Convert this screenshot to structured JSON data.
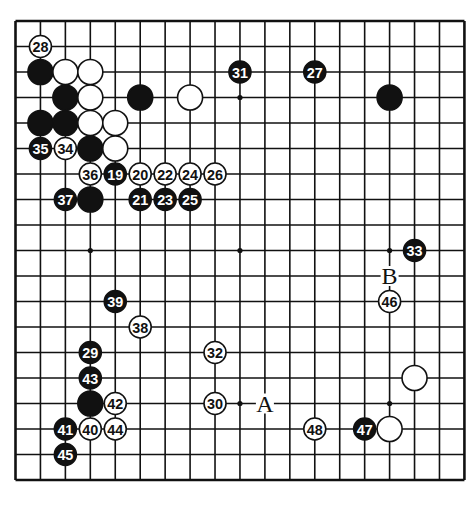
{
  "diagram": {
    "type": "go-board",
    "size": 19,
    "colors": {
      "background": "#ffffff",
      "line": "#111111",
      "black_stone": "#111111",
      "white_stone": "#ffffff",
      "black_text": "#ffffff",
      "white_text": "#111111"
    },
    "geometry": {
      "left": 15.5,
      "top": 21,
      "step_x": 24.94,
      "step_y": 25.5
    },
    "star_points": [
      [
        3,
        3
      ],
      [
        9,
        3
      ],
      [
        15,
        3
      ],
      [
        3,
        9
      ],
      [
        9,
        9
      ],
      [
        15,
        9
      ],
      [
        3,
        15
      ],
      [
        9,
        15
      ],
      [
        15,
        15
      ]
    ],
    "stones": [
      {
        "col": 1,
        "row": 1,
        "color": "white",
        "label": "28"
      },
      {
        "col": 1,
        "row": 2,
        "color": "black",
        "label": ""
      },
      {
        "col": 2,
        "row": 2,
        "color": "white",
        "label": ""
      },
      {
        "col": 3,
        "row": 2,
        "color": "white",
        "label": ""
      },
      {
        "col": 9,
        "row": 2,
        "color": "black",
        "label": "31"
      },
      {
        "col": 12,
        "row": 2,
        "color": "black",
        "label": "27"
      },
      {
        "col": 2,
        "row": 3,
        "color": "black",
        "label": ""
      },
      {
        "col": 3,
        "row": 3,
        "color": "white",
        "label": ""
      },
      {
        "col": 5,
        "row": 3,
        "color": "black",
        "label": ""
      },
      {
        "col": 7,
        "row": 3,
        "color": "white",
        "label": ""
      },
      {
        "col": 15,
        "row": 3,
        "color": "black",
        "label": ""
      },
      {
        "col": 1,
        "row": 4,
        "color": "black",
        "label": ""
      },
      {
        "col": 2,
        "row": 4,
        "color": "black",
        "label": ""
      },
      {
        "col": 3,
        "row": 4,
        "color": "white",
        "label": ""
      },
      {
        "col": 4,
        "row": 4,
        "color": "white",
        "label": ""
      },
      {
        "col": 1,
        "row": 5,
        "color": "black",
        "label": "35"
      },
      {
        "col": 2,
        "row": 5,
        "color": "white",
        "label": "34"
      },
      {
        "col": 3,
        "row": 5,
        "color": "black",
        "label": ""
      },
      {
        "col": 4,
        "row": 5,
        "color": "white",
        "label": ""
      },
      {
        "col": 3,
        "row": 6,
        "color": "white",
        "label": "36"
      },
      {
        "col": 4,
        "row": 6,
        "color": "black",
        "label": "19"
      },
      {
        "col": 5,
        "row": 6,
        "color": "white",
        "label": "20"
      },
      {
        "col": 6,
        "row": 6,
        "color": "white",
        "label": "22"
      },
      {
        "col": 7,
        "row": 6,
        "color": "white",
        "label": "24"
      },
      {
        "col": 8,
        "row": 6,
        "color": "white",
        "label": "26"
      },
      {
        "col": 2,
        "row": 7,
        "color": "black",
        "label": "37"
      },
      {
        "col": 3,
        "row": 7,
        "color": "black",
        "label": ""
      },
      {
        "col": 5,
        "row": 7,
        "color": "black",
        "label": "21"
      },
      {
        "col": 6,
        "row": 7,
        "color": "black",
        "label": "23"
      },
      {
        "col": 7,
        "row": 7,
        "color": "black",
        "label": "25"
      },
      {
        "col": 16,
        "row": 9,
        "color": "black",
        "label": "33"
      },
      {
        "col": 15,
        "row": 11,
        "color": "white",
        "label": "46"
      },
      {
        "col": 4,
        "row": 11,
        "color": "black",
        "label": "39"
      },
      {
        "col": 5,
        "row": 12,
        "color": "white",
        "label": "38"
      },
      {
        "col": 3,
        "row": 13,
        "color": "black",
        "label": "29"
      },
      {
        "col": 8,
        "row": 13,
        "color": "white",
        "label": "32"
      },
      {
        "col": 3,
        "row": 14,
        "color": "black",
        "label": "43"
      },
      {
        "col": 16,
        "row": 14,
        "color": "white",
        "label": ""
      },
      {
        "col": 3,
        "row": 15,
        "color": "black",
        "label": ""
      },
      {
        "col": 4,
        "row": 15,
        "color": "white",
        "label": "42"
      },
      {
        "col": 8,
        "row": 15,
        "color": "white",
        "label": "30"
      },
      {
        "col": 2,
        "row": 16,
        "color": "black",
        "label": "41"
      },
      {
        "col": 3,
        "row": 16,
        "color": "white",
        "label": "40"
      },
      {
        "col": 4,
        "row": 16,
        "color": "white",
        "label": "44"
      },
      {
        "col": 12,
        "row": 16,
        "color": "white",
        "label": "48"
      },
      {
        "col": 14,
        "row": 16,
        "color": "black",
        "label": "47"
      },
      {
        "col": 15,
        "row": 16,
        "color": "white",
        "label": ""
      },
      {
        "col": 2,
        "row": 17,
        "color": "black",
        "label": "45"
      }
    ],
    "markers": [
      {
        "col": 10,
        "row": 15,
        "label": "A"
      },
      {
        "col": 15,
        "row": 10,
        "label": "B"
      }
    ]
  }
}
